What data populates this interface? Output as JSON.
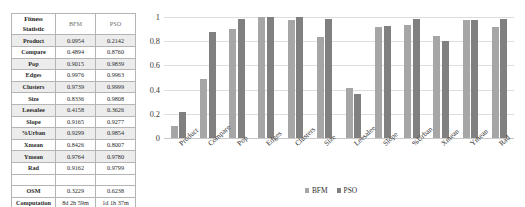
{
  "table": {
    "headers": [
      "Fitness Statistic",
      "BFM",
      "PSO"
    ],
    "header_label_line1": "Fitness",
    "header_label_line2": "Statistic",
    "rows": [
      {
        "label": "Product",
        "bfm": "0.0954",
        "pso": "0.2142"
      },
      {
        "label": "Compare",
        "bfm": "0.4894",
        "pso": "0.8760"
      },
      {
        "label": "Pop",
        "bfm": "0.9015",
        "pso": "0.9839"
      },
      {
        "label": "Edges",
        "bfm": "0.9976",
        "pso": "0.9963"
      },
      {
        "label": "Clusters",
        "bfm": "0.9739",
        "pso": "0.9999"
      },
      {
        "label": "Size",
        "bfm": "0.8336",
        "pso": "0.9808"
      },
      {
        "label": "Leesalee",
        "bfm": "0.4158",
        "pso": "0.3626"
      },
      {
        "label": "Slope",
        "bfm": "0.9165",
        "pso": "0.9277"
      },
      {
        "label": "%Urban",
        "bfm": "0.9299",
        "pso": "0.9854"
      },
      {
        "label": "Xmean",
        "bfm": "0.8426",
        "pso": "0.8007"
      },
      {
        "label": "Ymean",
        "bfm": "0.9764",
        "pso": "0.9780"
      },
      {
        "label": "Rad",
        "bfm": "0.9162",
        "pso": "0.9799"
      }
    ],
    "footer": [
      {
        "label": "OSM",
        "bfm": "0.3229",
        "pso": "0.6238"
      },
      {
        "label_line1": "Computation",
        "label_line2": "Time",
        "bfm_line1": "8d 2h 59m",
        "bfm_line2": "9s",
        "pso_line1": "1d 1h 37m",
        "pso_line2": "3s"
      }
    ]
  },
  "chart_data": {
    "type": "bar",
    "title": "",
    "xlabel": "",
    "ylabel": "",
    "ylim": [
      0,
      1
    ],
    "yticks": [
      "0",
      "0.2",
      "0.4",
      "0.6",
      "0.8",
      "1"
    ],
    "ytick_values": [
      0,
      0.2,
      0.4,
      0.6,
      0.8,
      1
    ],
    "grid": true,
    "legend_position": "bottom",
    "categories": [
      "Product",
      "Compare",
      "Pop",
      "Edges",
      "Clusters",
      "Size",
      "Leesalee",
      "Slope",
      "%Urban",
      "Xmean",
      "Ymean",
      "Rad"
    ],
    "series": [
      {
        "name": "BFM",
        "color": "#a6a6a6",
        "values": [
          0.0954,
          0.4894,
          0.9015,
          0.9976,
          0.9739,
          0.8336,
          0.4158,
          0.9165,
          0.9299,
          0.8426,
          0.9764,
          0.9162
        ]
      },
      {
        "name": "PSO",
        "color": "#808080",
        "values": [
          0.2142,
          0.876,
          0.9839,
          0.9963,
          0.9999,
          0.9808,
          0.3626,
          0.9277,
          0.9854,
          0.8007,
          0.978,
          0.9799
        ]
      }
    ]
  },
  "legend": {
    "items": [
      {
        "label": "BFM",
        "color": "#a6a6a6"
      },
      {
        "label": "PSO",
        "color": "#808080"
      }
    ]
  }
}
